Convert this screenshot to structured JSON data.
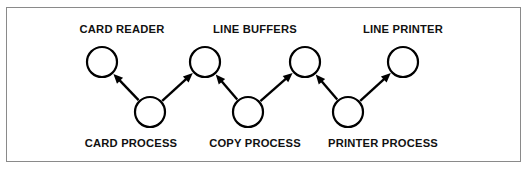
{
  "figure": {
    "background_color": "#ffffff",
    "frame_color": "#8a8a8a",
    "ink_color": "#000000"
  },
  "chart_data": {
    "type": "diagram",
    "title": "",
    "nodes": [
      {
        "id": "card-reader",
        "label": "CARD READER",
        "label_position": "above",
        "cx": 102,
        "cy": 62,
        "r": 15,
        "label_x": 122,
        "label_y": 30
      },
      {
        "id": "card-process",
        "label": "CARD PROCESS",
        "label_position": "below",
        "cx": 150,
        "cy": 112,
        "r": 15,
        "label_x": 131,
        "label_y": 144
      },
      {
        "id": "line-buffer-1",
        "label": "LINE BUFFERS",
        "label_position": "above",
        "cx": 205,
        "cy": 62,
        "r": 15,
        "label_x": 255,
        "label_y": 30
      },
      {
        "id": "copy-process",
        "label": "COPY PROCESS",
        "label_position": "below",
        "cx": 248,
        "cy": 112,
        "r": 15,
        "label_x": 255,
        "label_y": 144
      },
      {
        "id": "line-buffer-2",
        "label": "",
        "label_position": "none",
        "cx": 305,
        "cy": 62,
        "r": 15,
        "label_x": 0,
        "label_y": 0
      },
      {
        "id": "printer-process",
        "label": "PRINTER PROCESS",
        "label_position": "below",
        "cx": 348,
        "cy": 112,
        "r": 15,
        "label_x": 383,
        "label_y": 144
      },
      {
        "id": "line-printer",
        "label": "LINE PRINTER",
        "label_position": "above",
        "cx": 403,
        "cy": 62,
        "r": 15,
        "label_x": 403,
        "label_y": 30
      }
    ],
    "edges": [
      {
        "id": "edge-card-process-to-card-reader",
        "from": "card-process",
        "to": "card-reader",
        "direction": "up-left"
      },
      {
        "id": "edge-card-process-to-line-buffer-1",
        "from": "card-process",
        "to": "line-buffer-1",
        "direction": "up-right"
      },
      {
        "id": "edge-copy-process-to-line-buffer-1",
        "from": "copy-process",
        "to": "line-buffer-1",
        "direction": "up-left"
      },
      {
        "id": "edge-copy-process-to-line-buffer-2",
        "from": "copy-process",
        "to": "line-buffer-2",
        "direction": "up-right"
      },
      {
        "id": "edge-printer-process-to-line-buffer-2",
        "from": "printer-process",
        "to": "line-buffer-2",
        "direction": "up-left"
      },
      {
        "id": "edge-printer-process-to-line-printer",
        "from": "printer-process",
        "to": "line-printer",
        "direction": "up-right"
      }
    ],
    "labels": [
      "CARD READER",
      "LINE BUFFERS",
      "LINE PRINTER",
      "CARD PROCESS",
      "COPY PROCESS",
      "PRINTER PROCESS"
    ],
    "legend": [],
    "annotations": []
  }
}
